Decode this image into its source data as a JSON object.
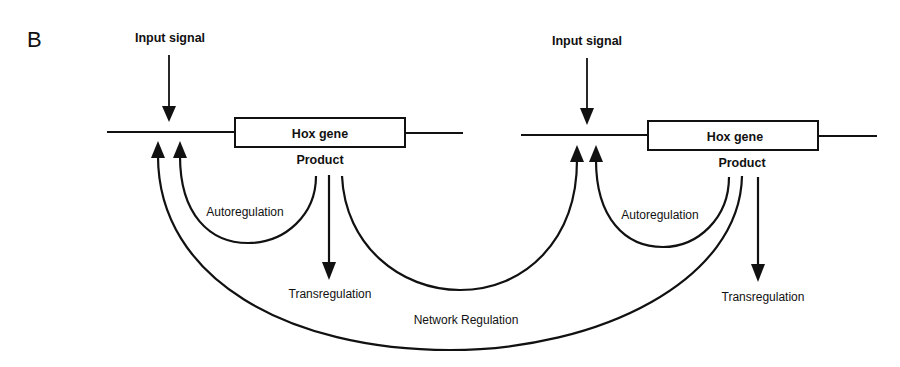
{
  "figure": {
    "panel_label": "B",
    "left_unit": {
      "input_signal": "Input signal",
      "gene_label": "Hox gene",
      "product_label": "Product",
      "autoregulation_label": "Autoregulation",
      "transregulation_label": "Transregulation"
    },
    "right_unit": {
      "input_signal": "Input signal",
      "gene_label": "Hox gene",
      "product_label": "Product",
      "autoregulation_label": "Autoregulation",
      "transregulation_label": "Transregulation"
    },
    "network_regulation_label": "Network Regulation",
    "colors": {
      "ink": "#111111",
      "background": "#ffffff"
    }
  }
}
